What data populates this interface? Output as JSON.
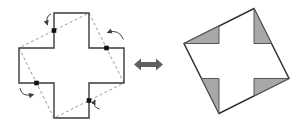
{
  "diagram": {
    "colors": {
      "background": "#ffffff",
      "cross_outline": "#3a3a3a",
      "dashed_line": "#8a8a8a",
      "hinge_dot": "#111111",
      "fold_arrow": "#3f3f3f",
      "double_arrow": "#5f5f5f",
      "square_outline": "#2b2b2b",
      "square_fill": "#ffffff",
      "triangle_fill": "#a8a8a8",
      "triangle_stroke": "#565656"
    },
    "left_figure": {
      "name": "greek-cross-with-cut-lines",
      "cross_outline_points": "54,13 89,13 89,48 124,48 124,83 89,83 89,118 54,118 54,83 19,83 19,48 54,48",
      "dashed_square_points": "89,13 124,83 54,118 19,48",
      "dashed_pattern": "2.8,2.6",
      "hinge_dots": [
        {
          "x": 54,
          "y": 30.5
        },
        {
          "x": 106.5,
          "y": 48
        },
        {
          "x": 89,
          "y": 100.5
        },
        {
          "x": 36.5,
          "y": 83
        }
      ],
      "hinge_dot_size": 4.6,
      "fold_arrows": [
        {
          "path": "M 51,14 Q 45,16.5 47.5,25"
        },
        {
          "path": "M 123.5,39.5 Q 119,28.5 107.5,32.5"
        },
        {
          "path": "M 20,88 Q 21.5,97.5 33.5,94.5"
        },
        {
          "path": "M 99.5,109 Q 92,107 95,100"
        }
      ]
    },
    "equivalence_arrow": {
      "name": "double-arrow",
      "points": "134,64.5 141,58.5 141,62 156,62 156,58.5 163,64.5 156,70.5 156,67 141,67 141,70.5"
    },
    "right_figure": {
      "name": "square-with-folded-flaps",
      "square_points": "254,8.5 289,78.5 219,113.5 184,43.5",
      "gray_triangles": [
        {
          "points": "254,8.5 254,43.5 271.5,43.5"
        },
        {
          "points": "184,43.5 219,26 219,43.5"
        },
        {
          "points": "289,78.5 254,78.5 254,96"
        },
        {
          "points": "219,113.5 201.5,78.5 219,78.5"
        }
      ]
    }
  }
}
